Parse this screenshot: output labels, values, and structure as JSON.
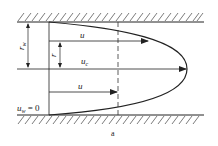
{
  "figure": {
    "caption": "a"
  },
  "labels": {
    "wall_radius": "r",
    "wall_radius_sub": "w",
    "radius": "r",
    "velocity_u_top": "u",
    "velocity_center": "u",
    "velocity_center_sub": "c",
    "velocity_u_bottom": "u",
    "wall_velocity": "u",
    "wall_velocity_sub": "w",
    "wall_velocity_eq": " = 0"
  },
  "colors": {
    "line": "#222222",
    "background": "#ffffff"
  }
}
